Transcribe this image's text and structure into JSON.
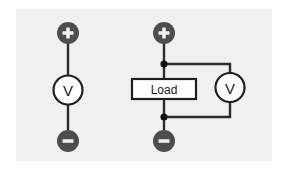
{
  "figure": {
    "background_color": "#ffffff",
    "plate_color": "#f0f0f0",
    "wire_color": "#2b2b2b",
    "terminal_color": "#4d4d4d",
    "meter_fill_color": "#ffffff",
    "width": 288,
    "height": 179
  },
  "circuits": [
    {
      "id": "left-circuit",
      "name": "voltmeter-alone",
      "terminals": {
        "positive": {
          "symbol": "+",
          "label": "plus-terminal"
        },
        "negative": {
          "symbol": "−",
          "label": "minus-terminal"
        }
      },
      "components": [
        {
          "type": "voltmeter",
          "label": "V",
          "name": "voltmeter"
        }
      ]
    },
    {
      "id": "right-circuit",
      "name": "voltmeter-across-load",
      "terminals": {
        "positive": {
          "symbol": "+",
          "label": "plus-terminal"
        },
        "negative": {
          "symbol": "−",
          "label": "minus-terminal"
        }
      },
      "components": [
        {
          "type": "load",
          "label": "Load",
          "name": "load-block"
        },
        {
          "type": "voltmeter",
          "label": "V",
          "name": "voltmeter"
        }
      ],
      "junctions": [
        {
          "name": "top-node"
        },
        {
          "name": "bottom-node"
        }
      ]
    }
  ]
}
